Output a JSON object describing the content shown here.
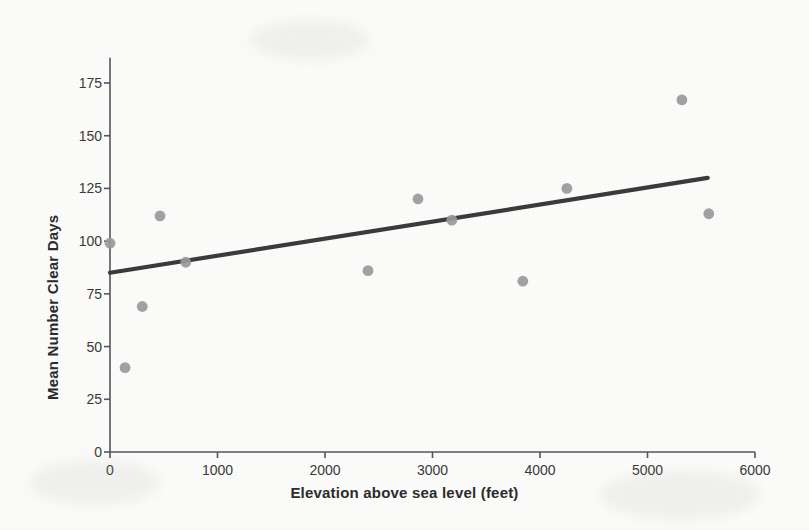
{
  "chart_data": {
    "type": "scatter",
    "title": "",
    "xlabel": "Elevation above sea level (feet)",
    "ylabel": "Mean Number Clear Days",
    "xlim": [
      0,
      6000
    ],
    "ylim": [
      0,
      187
    ],
    "xticks": [
      0,
      1000,
      2000,
      3000,
      4000,
      5000,
      6000
    ],
    "xtick_labels": [
      "0",
      "1000",
      "2000",
      "3000",
      "4000",
      "5000",
      "6000"
    ],
    "yticks": [
      0,
      25,
      50,
      75,
      100,
      125,
      150,
      175
    ],
    "ytick_labels": [
      "0",
      "25",
      "50",
      "75",
      "100",
      "125",
      "150",
      "175"
    ],
    "grid": false,
    "legend": false,
    "marker_color": "#9a9a9a",
    "line_color": "#3b3b3b",
    "axis_color": "#55565a",
    "background_color": "#fbfbfa",
    "points": [
      {
        "x": 0,
        "y": 99
      },
      {
        "x": 140,
        "y": 40
      },
      {
        "x": 300,
        "y": 69
      },
      {
        "x": 465,
        "y": 112
      },
      {
        "x": 705,
        "y": 90
      },
      {
        "x": 2400,
        "y": 86
      },
      {
        "x": 2865,
        "y": 120
      },
      {
        "x": 3180,
        "y": 110
      },
      {
        "x": 3840,
        "y": 81
      },
      {
        "x": 4250,
        "y": 125
      },
      {
        "x": 5320,
        "y": 167
      },
      {
        "x": 5570,
        "y": 113
      }
    ],
    "trendline": {
      "x_start": 0,
      "y_start": 85,
      "x_end": 5560,
      "y_end": 130
    }
  }
}
